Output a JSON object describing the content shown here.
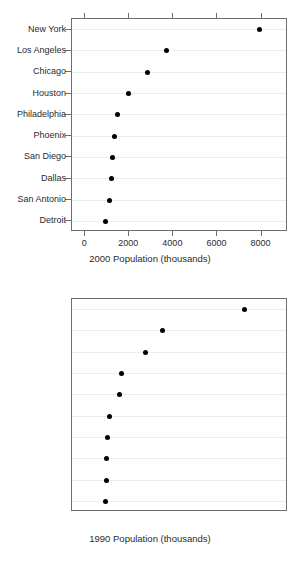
{
  "figure": {
    "background_color": "#ffffff",
    "panel_border_color": "#6e6e6e",
    "gridline_color": "#ececec",
    "dot_color": "#000000"
  },
  "chart_data": [
    {
      "type": "scatter",
      "variant": "dot-plot",
      "title": "",
      "xlabel": "2000 Population (thousands)",
      "ylabel": "",
      "xlim": [
        -600,
        9200
      ],
      "xticks": [
        0,
        2000,
        4000,
        6000,
        8000
      ],
      "xticklabels": [
        "0",
        "2000",
        "4000",
        "6000",
        "8000"
      ],
      "grid": true,
      "grid_axis": "y",
      "legend": false,
      "categories": [
        "New York",
        "Los Angeles",
        "Chicago",
        "Houston",
        "Philadelphia",
        "Phoenix",
        "San Diego",
        "Dallas",
        "San Antonio",
        "Detroit"
      ],
      "values": [
        7911,
        3689,
        2844,
        1956,
        1467,
        1333,
        1244,
        1200,
        1111,
        933
      ]
    },
    {
      "type": "scatter",
      "variant": "dot-plot",
      "title": "",
      "xlabel": "1990 Population (thousands)",
      "ylabel": "",
      "xlim": [
        -600,
        9200
      ],
      "xticks": [
        0,
        2000,
        4000,
        6000,
        8000
      ],
      "xticklabels": [
        "0",
        "2000",
        "4000",
        "6000",
        "8000"
      ],
      "grid": true,
      "grid_axis": "y",
      "legend": false,
      "categories": [
        "New York",
        "Los Angeles",
        "Chicago",
        "Houston",
        "Philadelphia",
        "San Diego",
        "Detroit",
        "Dallas",
        "Phoenix",
        "San Antonio"
      ],
      "values": [
        7244,
        3511,
        2756,
        1644,
        1556,
        1111,
        1022,
        978,
        978,
        933
      ]
    }
  ]
}
